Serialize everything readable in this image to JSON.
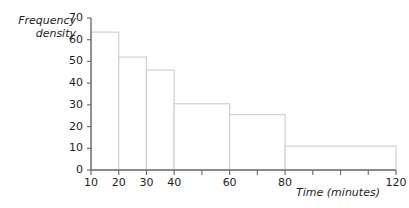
{
  "chart_data": {
    "type": "bar",
    "title": "",
    "xlabel": "Time (minutes)",
    "ylabel": "Frequency\ndensity",
    "ylabel_lines": [
      "Frequency",
      "density"
    ],
    "xlim": [
      10,
      120
    ],
    "ylim": [
      0,
      70
    ],
    "grid": false,
    "legend": null,
    "bar_style": "histogram-outline",
    "y_ticks": [
      0,
      10,
      20,
      30,
      40,
      50,
      60,
      70
    ],
    "y_tick_labels": [
      "0",
      "10",
      "20",
      "30",
      "40",
      "50",
      "60",
      "70"
    ],
    "x_ticks": [
      10,
      20,
      30,
      40,
      50,
      60,
      70,
      80,
      90,
      100,
      110,
      120
    ],
    "x_tick_labels_shown": [
      "10",
      "20",
      "30",
      "40",
      "60",
      "80",
      "120"
    ],
    "x_labeled_ticks": [
      10,
      20,
      30,
      40,
      60,
      80,
      120
    ],
    "bins": [
      {
        "start": 10,
        "end": 20,
        "frequency_density": 63.5
      },
      {
        "start": 20,
        "end": 30,
        "frequency_density": 52
      },
      {
        "start": 30,
        "end": 40,
        "frequency_density": 46
      },
      {
        "start": 40,
        "end": 60,
        "frequency_density": 30.5
      },
      {
        "start": 60,
        "end": 80,
        "frequency_density": 25.5
      },
      {
        "start": 80,
        "end": 120,
        "frequency_density": 11
      }
    ],
    "categories": [
      "10-20",
      "20-30",
      "30-40",
      "40-60",
      "60-80",
      "80-120"
    ],
    "values": [
      63.5,
      52,
      46,
      30.5,
      25.5,
      11
    ]
  },
  "colors": {
    "background": "#ffffff",
    "axis": "#6f6f6f",
    "bar_outline": "#d0d0d0",
    "bar_fill": "#ffffff",
    "text": "#1d1d1d",
    "tick": "#6f6f6f"
  },
  "geometry": {
    "plot_left": 91,
    "plot_right": 396,
    "plot_bottom": 170,
    "plot_top": 18
  }
}
